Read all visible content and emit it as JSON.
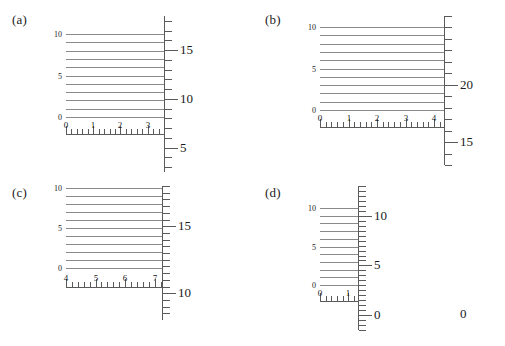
{
  "figure": {
    "background": "#ffffff",
    "line_color": "#8a8a8a",
    "axis_color": "#5a5a5a",
    "text_color": "#1a1a1a"
  },
  "chart_data": [
    {
      "type": "line",
      "panel": "(a)",
      "title": "",
      "xlabel": "",
      "ylabel": "",
      "grid": false,
      "legend": null,
      "left_axis": {
        "ticks": [
          0,
          5,
          10
        ],
        "tick_labels": [
          "0",
          "5",
          "10"
        ],
        "range": [
          0,
          10
        ]
      },
      "x_axis": {
        "ticks": [
          0,
          1,
          2,
          3
        ],
        "tick_labels": [
          "0",
          "1",
          "2",
          "3"
        ],
        "minor_per_major": 5,
        "range": [
          0,
          3.6
        ]
      },
      "right_axis": {
        "labeled_ticks": [
          5,
          10,
          15
        ],
        "tick_labels": [
          "5",
          "10",
          "15"
        ],
        "range": [
          2.5,
          18.5
        ]
      },
      "series": [
        {
          "name": "horizontal-levels",
          "values": [
            0,
            1,
            2,
            3,
            4,
            5,
            6,
            7,
            8,
            9,
            10
          ]
        }
      ]
    },
    {
      "type": "line",
      "panel": "(b)",
      "title": "",
      "xlabel": "",
      "ylabel": "",
      "grid": false,
      "legend": null,
      "left_axis": {
        "ticks": [
          0,
          5,
          10
        ],
        "tick_labels": [
          "0",
          "5",
          "10"
        ],
        "range": [
          0,
          10
        ]
      },
      "x_axis": {
        "ticks": [
          0,
          1,
          2,
          3,
          4
        ],
        "tick_labels": [
          "0",
          "1",
          "2",
          "3",
          "4"
        ],
        "minor_per_major": 5,
        "range": [
          0,
          4.35
        ]
      },
      "right_axis": {
        "labeled_ticks": [
          15,
          20,
          0
        ],
        "tick_labels": [
          "15",
          "20",
          "0"
        ],
        "range": [
          13,
          26
        ]
      },
      "series": [
        {
          "name": "horizontal-levels",
          "values": [
            0,
            1,
            2,
            3,
            4,
            5,
            6,
            7,
            8,
            9,
            10
          ]
        }
      ]
    },
    {
      "type": "line",
      "panel": "(c)",
      "title": "",
      "xlabel": "",
      "ylabel": "",
      "grid": false,
      "legend": null,
      "left_axis": {
        "ticks": [
          0,
          5,
          10
        ],
        "tick_labels": [
          "0",
          "5",
          "10"
        ],
        "range": [
          0,
          10
        ]
      },
      "x_axis": {
        "ticks": [
          4,
          5,
          6,
          7
        ],
        "tick_labels": [
          "4",
          "5",
          "6",
          "7"
        ],
        "minor_per_major": 5,
        "range": [
          4,
          7.25
        ]
      },
      "right_axis": {
        "labeled_ticks": [
          10,
          15
        ],
        "tick_labels": [
          "10",
          "15"
        ],
        "range": [
          8,
          18
        ]
      },
      "series": [
        {
          "name": "horizontal-levels",
          "values": [
            0,
            1,
            2,
            3,
            4,
            5,
            6,
            7,
            8,
            9,
            10
          ]
        }
      ]
    },
    {
      "type": "line",
      "panel": "(d)",
      "title": "",
      "xlabel": "",
      "ylabel": "",
      "grid": false,
      "legend": null,
      "left_axis": {
        "ticks": [
          0,
          5,
          10
        ],
        "tick_labels": [
          "0",
          "5",
          "10"
        ],
        "range": [
          0,
          10
        ]
      },
      "x_axis": {
        "ticks": [
          0,
          1
        ],
        "tick_labels": [
          "0",
          "1"
        ],
        "minor_per_major": 5,
        "range": [
          0,
          1.35
        ]
      },
      "right_axis": {
        "labeled_ticks": [
          0,
          5,
          10
        ],
        "tick_labels": [
          "0",
          "5",
          "10"
        ],
        "range": [
          -1.5,
          13
        ]
      },
      "series": [
        {
          "name": "horizontal-levels",
          "values": [
            0,
            1,
            2,
            3,
            4,
            5,
            6,
            7,
            8,
            9,
            10
          ]
        }
      ]
    }
  ]
}
